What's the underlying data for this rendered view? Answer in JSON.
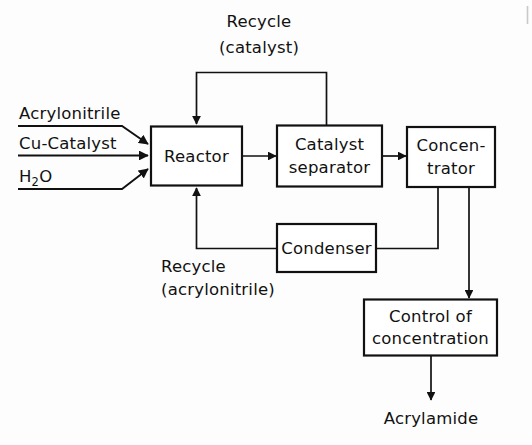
{
  "diagram": {
    "type": "process-flow-diagram",
    "stroke_color": "#111111",
    "background_color": "#fdfdfd",
    "boxes": [
      {
        "id": "reactor",
        "label": "Reactor",
        "lines": [
          "Reactor"
        ]
      },
      {
        "id": "catalyst-separator",
        "label": "Catalyst separator",
        "lines": [
          "Catalyst",
          "separator"
        ]
      },
      {
        "id": "concentrator",
        "label": "Concentrator",
        "lines": [
          "Concen-",
          "trator"
        ]
      },
      {
        "id": "condenser",
        "label": "Condenser",
        "lines": [
          "Condenser"
        ]
      },
      {
        "id": "control-of-concentration",
        "label": "Control of concentration",
        "lines": [
          "Control of",
          "concentration"
        ]
      }
    ],
    "feeds": [
      {
        "id": "acrylonitrile",
        "label": "Acrylonitrile"
      },
      {
        "id": "cu-catalyst",
        "label": "Cu-Catalyst"
      },
      {
        "id": "water",
        "label": "H2O",
        "label_main": "H",
        "label_sub": "2",
        "label_tail": "O"
      }
    ],
    "stream_labels": [
      {
        "id": "recycle-catalyst",
        "line1": "Recycle",
        "line2": "(catalyst)"
      },
      {
        "id": "recycle-acrylonitrile",
        "line1": "Recycle",
        "line2": "(acrylonitrile)"
      }
    ],
    "product": {
      "id": "acrylamide",
      "label": "Acrylamide"
    }
  }
}
